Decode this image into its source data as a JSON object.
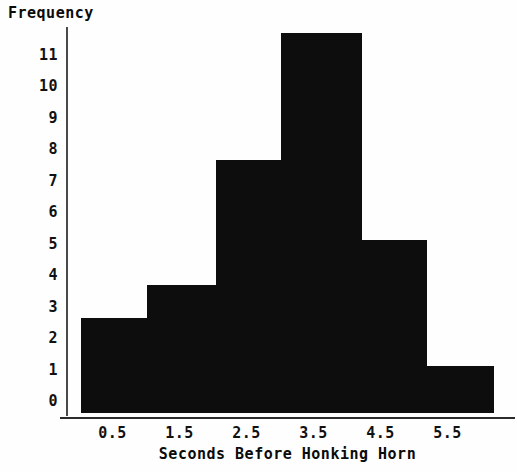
{
  "chart_data": {
    "type": "bar",
    "title": "",
    "xlabel": "Seconds Before Honking Horn",
    "ylabel": "Frequency",
    "grid": false,
    "legend": null,
    "xlim": [
      0.0,
      6.2
    ],
    "ylim": [
      0,
      11.7
    ],
    "xtick_labels": [
      "0.5",
      "1.5",
      "2.5",
      "3.5",
      "4.5",
      "5.5"
    ],
    "xtick_values": [
      0.5,
      1.5,
      2.5,
      3.5,
      4.5,
      5.5
    ],
    "ytick_labels": [
      "0",
      "1",
      "2",
      "3",
      "4",
      "5",
      "6",
      "7",
      "8",
      "9",
      "10",
      "11"
    ],
    "ytick_values": [
      0,
      1,
      2,
      3,
      4,
      5,
      6,
      7,
      8,
      9,
      10,
      11
    ],
    "bin_edges": [
      0.0,
      1.0,
      2.0,
      3.0,
      4.2,
      5.2,
      6.2
    ],
    "categories": [
      "0-1",
      "1-2",
      "2-3",
      "3-4.2",
      "4.2-5.2",
      "5.2-6.2"
    ],
    "values": [
      2.6,
      3.7,
      7.7,
      11.7,
      5.2,
      1.2
    ],
    "bar_color": "#0d0d0d",
    "axis_color": "#2b2b2b",
    "background_color": "#fefefe",
    "bars": [
      {
        "label": "bar-1",
        "value": 2.6,
        "x_left": 81,
        "x_right": 147,
        "y_top": 318
      },
      {
        "label": "bar-2",
        "value": 3.7,
        "x_left": 147,
        "x_right": 216,
        "y_top": 285
      },
      {
        "label": "bar-3",
        "value": 7.7,
        "x_left": 216,
        "x_right": 281,
        "y_top": 160
      },
      {
        "label": "bar-4",
        "value": 11.7,
        "x_left": 281,
        "x_right": 362,
        "y_top": 33
      },
      {
        "label": "bar-5",
        "value": 5.2,
        "x_left": 362,
        "x_right": 427,
        "y_top": 240
      },
      {
        "label": "bar-6",
        "value": 1.2,
        "x_left": 427,
        "x_right": 494,
        "y_top": 366
      }
    ]
  },
  "axes": {
    "y_title": "Frequency",
    "x_title": "Seconds Before Honking Horn"
  },
  "geometry": {
    "baseline_y": 413,
    "y_zero_px": 401,
    "px_per_unit_y": 31.5,
    "x_origin_px": 112.5,
    "px_per_unit_x": 67
  }
}
